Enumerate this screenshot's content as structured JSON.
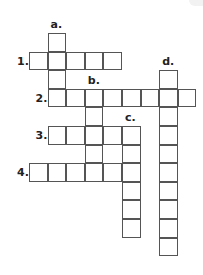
{
  "puzzle": {
    "type": "crossword",
    "grid_origin": {
      "x": 29,
      "y": 33
    },
    "cell_size": 18.6,
    "entries": [
      {
        "label": "1.",
        "direction": "across",
        "row": 1,
        "col": 0,
        "length": 5
      },
      {
        "label": "2.",
        "direction": "across",
        "row": 3,
        "col": 1,
        "length": 8
      },
      {
        "label": "3.",
        "direction": "across",
        "row": 5,
        "col": 1,
        "length": 5
      },
      {
        "label": "4.",
        "direction": "across",
        "row": 7,
        "col": 0,
        "length": 6
      },
      {
        "label": "a.",
        "direction": "down",
        "row": 0,
        "col": 1,
        "length": 4
      },
      {
        "label": "b.",
        "direction": "down",
        "row": 3,
        "col": 3,
        "length": 5
      },
      {
        "label": "c.",
        "direction": "down",
        "row": 5,
        "col": 5,
        "length": 6
      },
      {
        "label": "d.",
        "direction": "down",
        "row": 2,
        "col": 7,
        "length": 10
      }
    ]
  }
}
